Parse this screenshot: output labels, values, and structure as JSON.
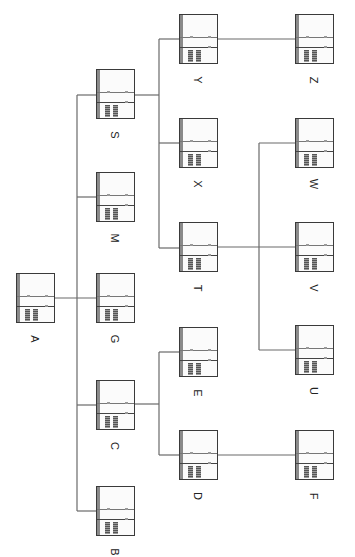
{
  "diagram": {
    "type": "hierarchy-tree",
    "orientation": "rotated-90",
    "line_color": "#6a6a6a",
    "nodes": [
      {
        "id": "A",
        "label": "A",
        "x": 16,
        "y": 273
      },
      {
        "id": "B",
        "label": "B",
        "x": 96,
        "y": 486
      },
      {
        "id": "C",
        "label": "C",
        "x": 96,
        "y": 380
      },
      {
        "id": "G",
        "label": "G",
        "x": 96,
        "y": 273
      },
      {
        "id": "M",
        "label": "M",
        "x": 96,
        "y": 172
      },
      {
        "id": "S",
        "label": "S",
        "x": 96,
        "y": 69
      },
      {
        "id": "D",
        "label": "D",
        "x": 179,
        "y": 430
      },
      {
        "id": "E",
        "label": "E",
        "x": 179,
        "y": 327
      },
      {
        "id": "T",
        "label": "T",
        "x": 179,
        "y": 222
      },
      {
        "id": "X",
        "label": "X",
        "x": 179,
        "y": 118
      },
      {
        "id": "Y",
        "label": "Y",
        "x": 179,
        "y": 14
      },
      {
        "id": "F",
        "label": "F",
        "x": 295,
        "y": 430
      },
      {
        "id": "U",
        "label": "U",
        "x": 295,
        "y": 325
      },
      {
        "id": "V",
        "label": "V",
        "x": 295,
        "y": 222
      },
      {
        "id": "W",
        "label": "W",
        "x": 295,
        "y": 118
      },
      {
        "id": "Z",
        "label": "Z",
        "x": 295,
        "y": 14
      }
    ],
    "edges": [
      [
        "A",
        "G"
      ],
      [
        "A",
        "B"
      ],
      [
        "A",
        "C"
      ],
      [
        "A",
        "M"
      ],
      [
        "A",
        "S"
      ],
      [
        "S",
        "Y"
      ],
      [
        "S",
        "X"
      ],
      [
        "S",
        "T"
      ],
      [
        "C",
        "D"
      ],
      [
        "C",
        "E"
      ],
      [
        "Y",
        "Z"
      ],
      [
        "D",
        "F"
      ],
      [
        "T",
        "U"
      ],
      [
        "T",
        "V"
      ],
      [
        "T",
        "W"
      ]
    ],
    "caption": ""
  }
}
